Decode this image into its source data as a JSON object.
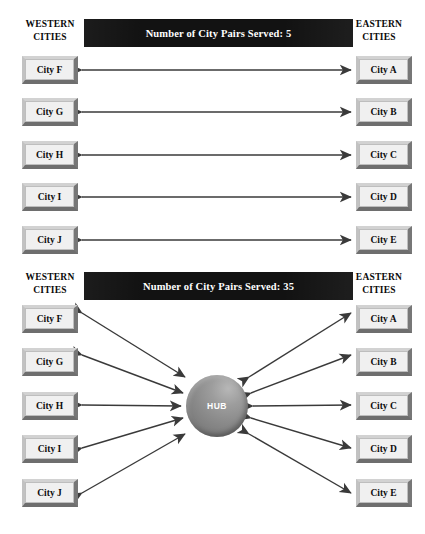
{
  "colors": {
    "bar_background": "#121212",
    "bar_text": "#ffffff",
    "box_face": "#f0f0f0",
    "box_highlight": "#d2d2d2",
    "box_shadow": "#6e6e6e",
    "arrow": "#3a3a3a",
    "hub": "#8b8b8b",
    "page_background": "#ffffff"
  },
  "diagrams": [
    {
      "id": "point-to-point",
      "title": "Number of City Pairs Served: 5",
      "west_heading_line1": "WESTERN",
      "west_heading_line2": "CITIES",
      "east_heading_line1": "EASTERN",
      "east_heading_line2": "CITIES",
      "west_cities": [
        "City F",
        "City G",
        "City H",
        "City I",
        "City J"
      ],
      "east_cities": [
        "City A",
        "City B",
        "City C",
        "City D",
        "City E"
      ],
      "hub_label": null
    },
    {
      "id": "hub-and-spoke",
      "title": "Number of City Pairs Served: 35",
      "west_heading_line1": "WESTERN",
      "west_heading_line2": "CITIES",
      "east_heading_line1": "EASTERN",
      "east_heading_line2": "CITIES",
      "west_cities": [
        "City F",
        "City G",
        "City H",
        "City I",
        "City J"
      ],
      "east_cities": [
        "City A",
        "City B",
        "City C",
        "City D",
        "City E"
      ],
      "hub_label": "HUB"
    }
  ]
}
